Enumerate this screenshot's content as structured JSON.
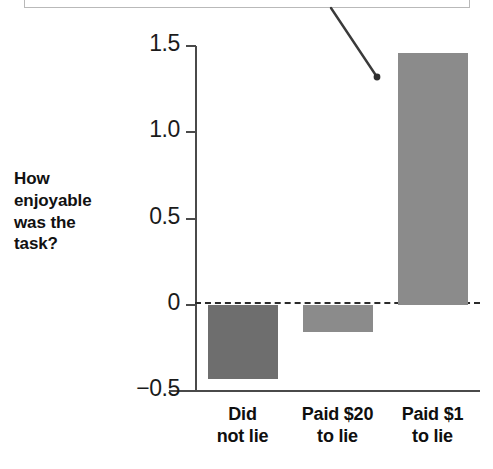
{
  "caption": {
    "text": "the task had been"
  },
  "annotation": {
    "leader_color": "#3a3a3a"
  },
  "chart_data": {
    "type": "bar",
    "title": "",
    "subtitle": "",
    "xlabel": "",
    "ylabel": "How enjoyable was the task?",
    "ylabel_lines": [
      "How",
      "enjoyable",
      "was the",
      "task?"
    ],
    "categories": [
      "Did not lie",
      "Paid $20 to lie",
      "Paid $1 to lie"
    ],
    "category_lines": [
      [
        "Did",
        "not lie"
      ],
      [
        "Paid $20",
        "to lie"
      ],
      [
        "Paid $1",
        "to lie"
      ]
    ],
    "values": [
      -0.43,
      -0.16,
      1.46
    ],
    "ylim": [
      -0.5,
      1.5
    ],
    "yticks": [
      1.5,
      1.0,
      0.5,
      0
    ],
    "ytick_labels": [
      "1.5",
      "1.0",
      "0.5",
      "0"
    ],
    "ybottom_tick_label": "−0.5",
    "grid": false,
    "legend": "none",
    "zero_line": true,
    "zero_line_style": "dashed",
    "bar_colors": [
      "#6e6e6e",
      "#8b8b8b",
      "#8b8b8b"
    ]
  }
}
